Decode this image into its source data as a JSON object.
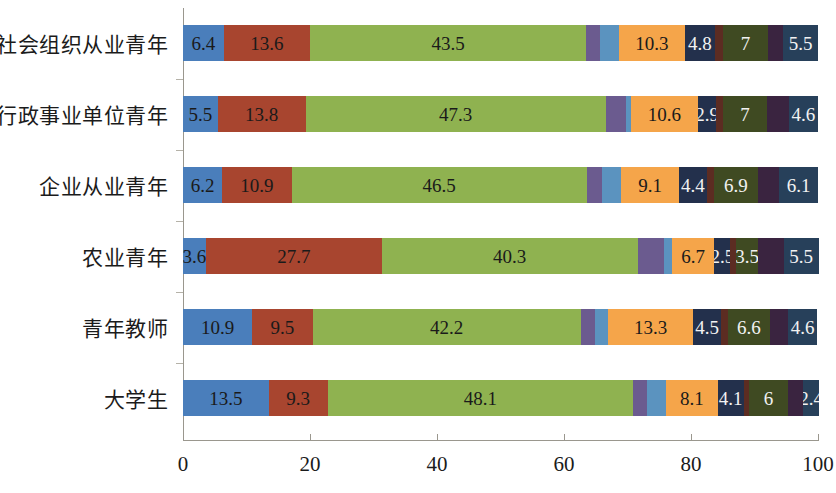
{
  "chart_data": {
    "type": "bar",
    "orientation": "horizontal",
    "stacked": true,
    "stack_mode": "percent",
    "title": "",
    "subtitle": "",
    "xlabel": "",
    "ylabel": "",
    "xlim": [
      0,
      100
    ],
    "xticks": [
      0,
      20,
      40,
      60,
      80,
      100
    ],
    "xtick_labels": [
      "0",
      "20",
      "40",
      "60",
      "80",
      "100"
    ],
    "grid": false,
    "legend": "none",
    "categories": [
      "社会组织从业青年",
      "行政事业单位青年",
      "企业从业青年",
      "农业青年",
      "青年教师",
      "大学生"
    ],
    "series": [
      {
        "name": "series-1",
        "color": "#4A7EBB",
        "values": [
          6.4,
          5.5,
          6.2,
          3.6,
          10.9,
          13.5
        ]
      },
      {
        "name": "series-2",
        "color": "#A8452F",
        "values": [
          13.6,
          13.8,
          10.9,
          27.7,
          9.5,
          9.3
        ]
      },
      {
        "name": "series-3",
        "color": "#8FB250",
        "values": [
          43.5,
          47.3,
          46.5,
          40.3,
          42.2,
          48.1
        ]
      },
      {
        "name": "series-4",
        "color": "#6B5B8F",
        "values": [
          2.2,
          3.1,
          2.4,
          4.2,
          2.3,
          2.2
        ]
      },
      {
        "name": "series-5",
        "color": "#5B93BF",
        "values": [
          3.0,
          0.8,
          3.0,
          1.2,
          2.1,
          3.0
        ]
      },
      {
        "name": "series-6",
        "color": "#F5A54A",
        "values": [
          10.3,
          10.6,
          9.1,
          6.7,
          13.3,
          8.1
        ]
      },
      {
        "name": "series-7",
        "color": "#23304C",
        "values": [
          4.8,
          2.9,
          4.4,
          2.5,
          4.5,
          4.1
        ]
      },
      {
        "name": "series-8",
        "color": "#5C2C22",
        "values": [
          1.3,
          1.0,
          1.1,
          0.9,
          1.0,
          0.9
        ]
      },
      {
        "name": "series-9",
        "color": "#3F4A22",
        "values": [
          7.0,
          7.0,
          6.9,
          3.5,
          6.6,
          6.0
        ]
      },
      {
        "name": "series-10",
        "color": "#3A2440",
        "values": [
          2.4,
          3.4,
          3.4,
          4.0,
          2.9,
          2.5
        ]
      },
      {
        "name": "series-11",
        "color": "#27405A",
        "values": [
          5.5,
          4.6,
          6.1,
          5.5,
          4.6,
          2.4
        ]
      }
    ],
    "bar_labels": [
      {
        "category": "社会组织从业青年",
        "labels": [
          "6.4",
          "13.6",
          "43.5",
          "",
          "",
          "10.3",
          "4.8",
          "",
          "7",
          "",
          "5.5"
        ]
      },
      {
        "category": "行政事业单位青年",
        "labels": [
          "5.5",
          "13.8",
          "47.3",
          "",
          "",
          "10.6",
          "2.9",
          "",
          "7",
          "",
          "4.6"
        ]
      },
      {
        "category": "企业从业青年",
        "labels": [
          "6.2",
          "10.9",
          "46.5",
          "",
          "",
          "9.1",
          "4.4",
          "",
          "6.9",
          "",
          "6.1"
        ]
      },
      {
        "category": "农业青年",
        "labels": [
          "3.6",
          "27.7",
          "40.3",
          "",
          "",
          "6.7",
          "2.5",
          "",
          "3.5",
          "",
          "5.5"
        ]
      },
      {
        "category": "青年教师",
        "labels": [
          "10.9",
          "9.5",
          "42.2",
          "",
          "",
          "13.3",
          "4.5",
          "",
          "6.6",
          "",
          "4.6"
        ]
      },
      {
        "category": "大学生",
        "labels": [
          "13.5",
          "9.3",
          "48.1",
          "",
          "",
          "8.1",
          "4.1",
          "",
          "6",
          "",
          "2.4"
        ]
      }
    ],
    "label_text_color": [
      "dark",
      "dark",
      "dark",
      "light",
      "light",
      "dark",
      "light",
      "light",
      "light",
      "light",
      "light"
    ]
  },
  "axis": {
    "x_tick_labels": [
      "0",
      "20",
      "40",
      "60",
      "80",
      "100"
    ],
    "axis_color": "#9a978e"
  }
}
